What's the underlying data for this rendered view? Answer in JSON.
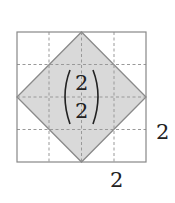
{
  "diagram": {
    "grid": {
      "rows": 4,
      "cols": 4,
      "line_color": "#999999",
      "border_color": "#888888"
    },
    "rhombus": {
      "fill": "#d9d9d9",
      "stroke": "#8a8a8a"
    },
    "vector": {
      "top": "2",
      "bottom": "2"
    },
    "side_label_right": "2",
    "side_label_bottom": "2"
  }
}
